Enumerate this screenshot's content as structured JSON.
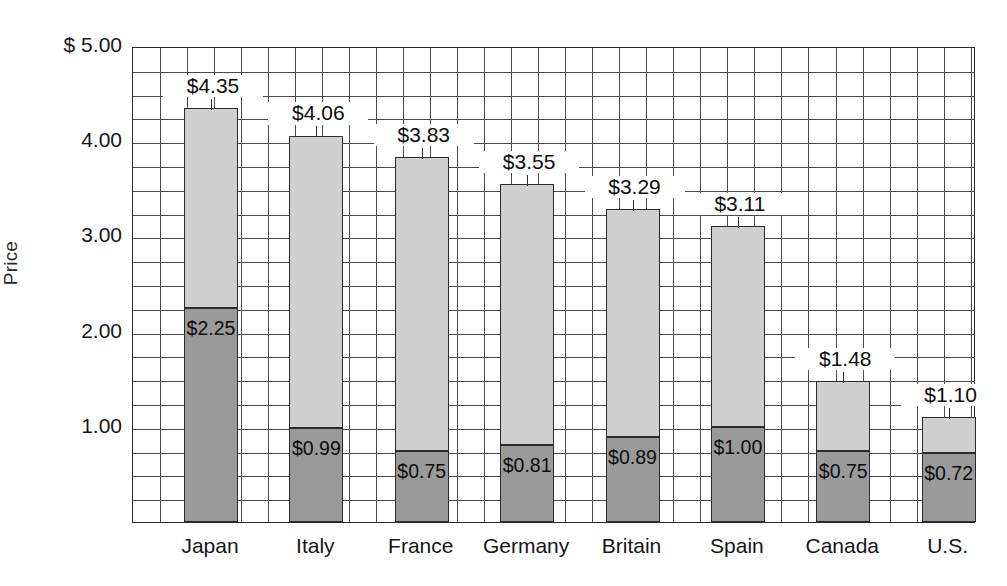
{
  "chart_data": {
    "type": "bar",
    "subtype": "stacked",
    "title": "",
    "xlabel": "",
    "ylabel": "Price",
    "ylim": [
      0,
      5.0
    ],
    "ytick_values": [
      5.0,
      4.0,
      3.0,
      2.0,
      1.0
    ],
    "ytick_labels": [
      "$ 5.00",
      "4.00",
      "3.00",
      "2.00",
      "1.00"
    ],
    "grid": true,
    "grid_step": 0.25,
    "legend": "none",
    "categories": [
      "Japan",
      "Italy",
      "France",
      "Germany",
      "Britain",
      "Spain",
      "Canada",
      "U.S."
    ],
    "series": [
      {
        "name": "base",
        "color": "#9a9a9a",
        "values": [
          2.25,
          0.99,
          0.75,
          0.81,
          0.89,
          1.0,
          0.75,
          0.72
        ],
        "labels": [
          "$2.25",
          "$0.99",
          "$0.75",
          "$0.81",
          "$0.89",
          "$1.00",
          "$0.75",
          "$0.72"
        ]
      },
      {
        "name": "upper",
        "color": "#cfcfcf",
        "values": [
          2.1,
          3.07,
          3.08,
          2.74,
          2.4,
          2.11,
          0.73,
          0.38
        ]
      }
    ],
    "totals": [
      4.35,
      4.06,
      3.83,
      3.55,
      3.29,
      3.11,
      1.48,
      1.1
    ],
    "total_labels": [
      "$4.35",
      "$4.06",
      "$3.83",
      "$3.55",
      "$3.29",
      "$3.11",
      "$1.48",
      "$1.10"
    ]
  },
  "axis": {
    "y_title": "Price"
  }
}
